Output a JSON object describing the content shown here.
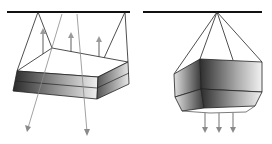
{
  "diagram": {
    "title": "",
    "panels": [
      {
        "id": "left",
        "subject": "suspended flat box luminaire",
        "light_directions": [
          "up",
          "down"
        ],
        "up_arrows": 3,
        "down_arrows": 2
      },
      {
        "id": "right",
        "subject": "suspended hexagonal drum luminaire",
        "light_directions": [
          "down"
        ],
        "down_arrows": 3
      }
    ],
    "colors": {
      "ceiling": "#111111",
      "wire": "#222222",
      "arrow": "#8a8a8a",
      "shade_dark": "#2a2a2a",
      "shade_light": "#f2f2f2",
      "background": "#ffffff"
    }
  }
}
